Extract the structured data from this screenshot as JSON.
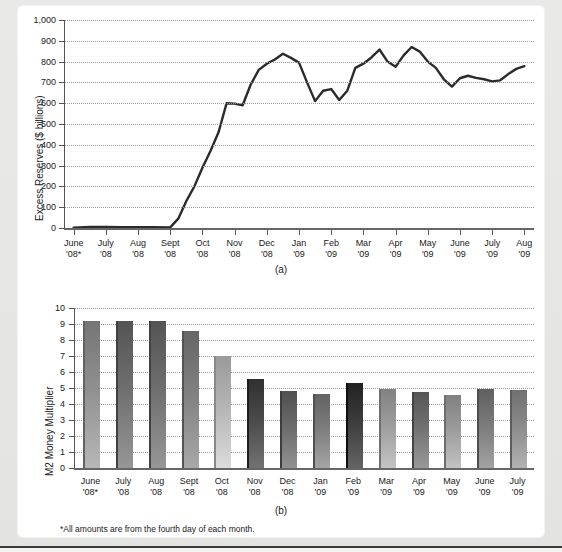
{
  "figure": {
    "footnote": "*All amounts are from the fourth day of each month.",
    "panel_a_letter": "(a)",
    "panel_b_letter": "(b)"
  },
  "chart_data": [
    {
      "type": "line",
      "panel": "(a)",
      "title": "",
      "xlabel": "",
      "ylabel": "Excess Reserves ($ billions)",
      "ylim": [
        0,
        1000
      ],
      "yticks": [
        0,
        100,
        200,
        300,
        400,
        500,
        600,
        700,
        800,
        900,
        1000
      ],
      "ytick_labels": [
        "0",
        "100",
        "200",
        "300",
        "400",
        "500",
        "600",
        "700",
        "800",
        "900",
        "1,000"
      ],
      "grid": true,
      "legend": "none",
      "categories": [
        "June '08*",
        "July '08",
        "Aug '08",
        "Sept '08",
        "Oct '08",
        "Nov '08",
        "Dec '08",
        "Jan '09",
        "Feb '09",
        "Mar '09",
        "Apr '09",
        "May '09",
        "June '09",
        "July '09",
        "Aug '09"
      ],
      "tick_labels_line1": [
        "June",
        "July",
        "Aug",
        "Sept",
        "Oct",
        "Nov",
        "Dec",
        "Jan",
        "Feb",
        "Mar",
        "Apr",
        "May",
        "June",
        "July",
        "Aug"
      ],
      "tick_labels_line2": [
        "'08*",
        "'08",
        "'08",
        "'08",
        "'08",
        "'08",
        "'08",
        "'09",
        "'09",
        "'09",
        "'09",
        "'09",
        "'09",
        "'09",
        "'09"
      ],
      "x": [
        0,
        0.5,
        1,
        1.5,
        2,
        2.5,
        3,
        3.25,
        3.5,
        3.75,
        4,
        4.25,
        4.5,
        4.75,
        5,
        5.25,
        5.5,
        5.75,
        6,
        6.25,
        6.5,
        6.75,
        7,
        7.25,
        7.5,
        7.75,
        8,
        8.25,
        8.5,
        8.75,
        9,
        9.25,
        9.5,
        9.75,
        10,
        10.25,
        10.5,
        10.75,
        11,
        11.25,
        11.5,
        11.75,
        12,
        12.25,
        12.5,
        12.75,
        13,
        13.25,
        13.5,
        13.75,
        14
      ],
      "values": [
        2,
        5,
        5,
        4,
        4,
        4,
        3,
        45,
        130,
        200,
        290,
        370,
        460,
        600,
        598,
        590,
        690,
        760,
        790,
        810,
        838,
        818,
        795,
        700,
        610,
        660,
        668,
        615,
        660,
        770,
        790,
        820,
        858,
        800,
        775,
        830,
        870,
        848,
        800,
        770,
        715,
        680,
        720,
        732,
        722,
        715,
        705,
        710,
        740,
        765,
        778
      ]
    },
    {
      "type": "bar",
      "panel": "(b)",
      "title": "",
      "xlabel": "",
      "ylabel": "M2 Money Multiplier",
      "ylim": [
        0,
        10
      ],
      "yticks": [
        0,
        1,
        2,
        3,
        4,
        5,
        6,
        7,
        8,
        9,
        10
      ],
      "ytick_labels": [
        "0",
        "1",
        "2",
        "3",
        "4",
        "5",
        "6",
        "7",
        "8",
        "9",
        "10"
      ],
      "grid": true,
      "legend": "none",
      "categories": [
        "June '08*",
        "July '08",
        "Aug '08",
        "Sept '08",
        "Oct '08",
        "Nov '08",
        "Dec '08",
        "Jan '09",
        "Feb '09",
        "Mar '09",
        "Apr '09",
        "May '09",
        "June '09",
        "July '09"
      ],
      "tick_labels_line1": [
        "June",
        "July",
        "Aug",
        "Sept",
        "Oct",
        "Nov",
        "Dec",
        "Jan",
        "Feb",
        "Mar",
        "Apr",
        "May",
        "June",
        "July"
      ],
      "tick_labels_line2": [
        "'08*",
        "'08",
        "'08",
        "'08",
        "'08",
        "'08",
        "'08",
        "'09",
        "'09",
        "'09",
        "'09",
        "'09",
        "'09",
        "'09"
      ],
      "values": [
        9.2,
        9.2,
        9.2,
        8.55,
        7.0,
        5.55,
        4.8,
        4.65,
        5.3,
        4.95,
        4.75,
        4.55,
        4.95,
        4.9
      ],
      "bar_colors": [
        "#8f8f8f",
        "#6e6e6e",
        "#6e6e6e",
        "#808080",
        "#b4b4b4",
        "#4a4a4a",
        "#6a6a6a",
        "#7c7c7c",
        "#3c3c3c",
        "#9c9c9c",
        "#707070",
        "#9a9a9a",
        "#7a7a7a",
        "#8a8a8a"
      ]
    }
  ],
  "colors": {
    "line_stroke": "#2b2b2b",
    "grid": "#9a9a9a",
    "axis": "#555555",
    "paper": "#ffffff",
    "page_background": "#e8e8e6",
    "text": "#1a1a1a"
  }
}
